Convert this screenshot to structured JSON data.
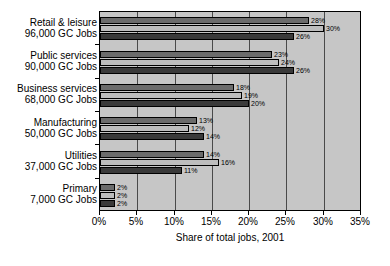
{
  "chart_data": {
    "type": "bar",
    "orientation": "horizontal",
    "title": "",
    "xlabel": "Share of total jobs, 2001",
    "ylabel": "",
    "xlim": [
      0,
      35
    ],
    "xticks": [
      "0%",
      "5%",
      "10%",
      "15%",
      "20%",
      "25%",
      "30%",
      "35%"
    ],
    "xtick_values": [
      0,
      5,
      10,
      15,
      20,
      25,
      30,
      35
    ],
    "grid": true,
    "legend": "none",
    "categories": [
      "Retail & leisure",
      "Public services",
      "Business services",
      "Manufacturing",
      "Utilities",
      "Primary"
    ],
    "category_sublabels": [
      "96,000 GC Jobs",
      "90,000 GC Jobs",
      "68,000 GC Jobs",
      "50,000 GC Jobs",
      "37,000 GC Jobs",
      "7,000 GC Jobs"
    ],
    "series": [
      {
        "name": "series-1",
        "color": "#6b6b6b",
        "values": [
          28,
          23,
          18,
          13,
          14,
          2
        ]
      },
      {
        "name": "series-2",
        "color": "#bdbdbd",
        "values": [
          30,
          24,
          19,
          12,
          16,
          2
        ]
      },
      {
        "name": "series-3",
        "color": "#3a3a3a",
        "values": [
          26,
          26,
          20,
          14,
          11,
          2
        ]
      }
    ],
    "bar_labels": [
      [
        "28%",
        "30%",
        "26%"
      ],
      [
        "23%",
        "24%",
        "26%"
      ],
      [
        "18%",
        "19%",
        "20%"
      ],
      [
        "13%",
        "12%",
        "14%"
      ],
      [
        "14%",
        "16%",
        "11%"
      ],
      [
        "2%",
        "2%",
        "2%"
      ]
    ]
  },
  "colors": {
    "plot_background": "#c6c6c6",
    "page_background": "#ffffff",
    "axis": "#000000",
    "gridline": "#4a4a4a"
  }
}
